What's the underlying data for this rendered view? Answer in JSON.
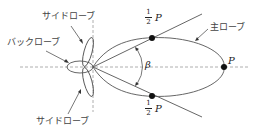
{
  "labels": {
    "side_lobe_top": "サイドローブ",
    "back_lobe": "バックローブ",
    "side_lobe_bottom": "サイドローブ",
    "main_lobe": "主ローブ",
    "beam_angle": "β",
    "peak": "P",
    "half_top_num": "1",
    "half_top_den": "2",
    "half_top_p": "P",
    "half_bottom_num": "1",
    "half_bottom_den": "2",
    "half_bottom_p": "P"
  },
  "colors": {
    "stroke": "#555555",
    "dash": "#999999",
    "dot": "#111111"
  }
}
